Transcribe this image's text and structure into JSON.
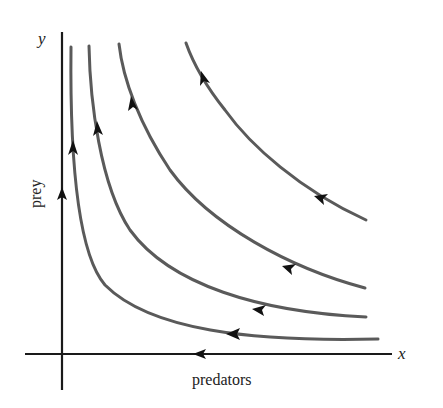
{
  "diagram": {
    "x_axis": {
      "symbol": "x",
      "label": "predators"
    },
    "y_axis": {
      "symbol": "y",
      "label": "prey"
    },
    "colors": {
      "axis": "#1a1a1a",
      "trajectory": "#5a5a5a",
      "arrow": "#111111"
    },
    "trajectories": [
      {
        "name": "trajectory-1",
        "direction": "up-left"
      },
      {
        "name": "trajectory-2",
        "direction": "up-left"
      },
      {
        "name": "trajectory-3",
        "direction": "up-left"
      },
      {
        "name": "trajectory-4",
        "direction": "up-left"
      }
    ],
    "axis_flows": [
      {
        "axis": "y",
        "direction": "up"
      },
      {
        "axis": "x",
        "direction": "left"
      }
    ]
  }
}
